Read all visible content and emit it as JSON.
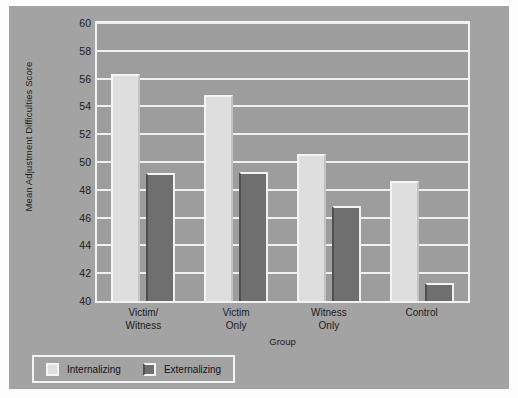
{
  "chart_data": {
    "type": "bar",
    "title": "",
    "xlabel": "Group",
    "ylabel": "Mean Adjustment Difficulties Score",
    "ylim": [
      40,
      60
    ],
    "ytick_step": 2,
    "yticks": [
      "60",
      "58",
      "56",
      "54",
      "52",
      "50",
      "48",
      "46",
      "44",
      "42",
      "40"
    ],
    "grid": true,
    "legend_position": "bottom-left",
    "categories": [
      "Victim/\nWitness",
      "Victim\nOnly",
      "Witness\nOnly",
      "Control"
    ],
    "series": [
      {
        "name": "Internalizing",
        "color": "#dedede",
        "values": [
          56.3,
          54.8,
          50.6,
          48.6
        ]
      },
      {
        "name": "Externalizing",
        "color": "#6f6f6f",
        "values": [
          49.2,
          49.3,
          46.8,
          41.3
        ]
      }
    ]
  },
  "legend": {
    "items": [
      {
        "label": "Internalizing",
        "swatch": "light"
      },
      {
        "label": "Externalizing",
        "swatch": "dark"
      }
    ]
  },
  "colors": {
    "figure_background": "#a3a3a3",
    "plot_background": "#9d9d9d",
    "gridline": "#f0f0f0",
    "frame": "#f2f2f2",
    "text": "#1b1b1b",
    "series_internalizing": "#dedede",
    "series_externalizing": "#6f6f6f"
  }
}
